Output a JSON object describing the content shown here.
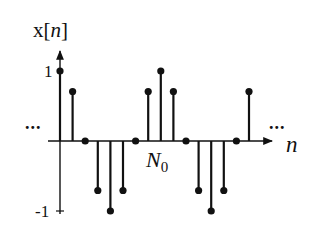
{
  "chart_data": {
    "type": "stem",
    "title": "",
    "ylabel": "x[n]",
    "xlabel": "n",
    "period_label": "N0",
    "period": 8,
    "n": [
      0,
      1,
      2,
      3,
      4,
      5,
      6,
      7,
      8,
      9,
      10,
      11,
      12,
      13,
      14,
      15
    ],
    "values": [
      1,
      0.707,
      0,
      -0.707,
      -1,
      -0.707,
      0,
      0.707,
      1,
      0.707,
      0,
      -0.707,
      -1,
      -0.707,
      0,
      0.707
    ],
    "yticks": [
      1,
      -1
    ],
    "ytick_labels": [
      "1",
      "-1"
    ],
    "ylim": [
      -1,
      1
    ],
    "continuation": "...",
    "grid": false,
    "legend": null
  },
  "labels": {
    "y_axis_main": "x[",
    "y_axis_var": "n",
    "y_axis_close": "]",
    "x_axis": "n",
    "period_main": "N",
    "period_sub": "0",
    "tick_one": "1",
    "tick_neg_one": "-1",
    "ellipsis_left": "...",
    "ellipsis_right": "..."
  },
  "style": {
    "ink": "#111111"
  }
}
